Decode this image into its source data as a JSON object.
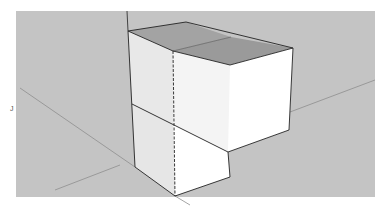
{
  "viewport": {
    "background": "#c4c4c4",
    "description": "3D modeling viewport showing an L-shaped stack of three cubes"
  },
  "model": {
    "name": "cube-stack",
    "faces": {
      "top_color": "#9e9e9e",
      "front_left_color": "#e6e6e6",
      "front_right_color": "#ffffff",
      "edge_color": "#222222"
    }
  },
  "axes": {
    "color": "#8a8a8a",
    "label": "J"
  }
}
